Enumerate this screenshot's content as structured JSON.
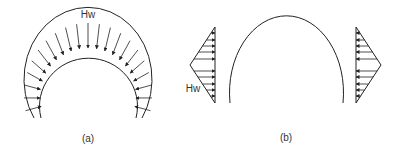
{
  "figure": {
    "panels": [
      {
        "id": "a",
        "caption": "(a)",
        "load_label": "Hw",
        "description": "Horseshoe arch with radial uniform load on crown"
      },
      {
        "id": "b",
        "caption": "(b)",
        "load_label": "Hw",
        "description": "Arch with triangular lateral loads on both sides"
      }
    ],
    "colors": {
      "line": "#222222",
      "text": "#333333",
      "background": "#ffffff"
    }
  }
}
